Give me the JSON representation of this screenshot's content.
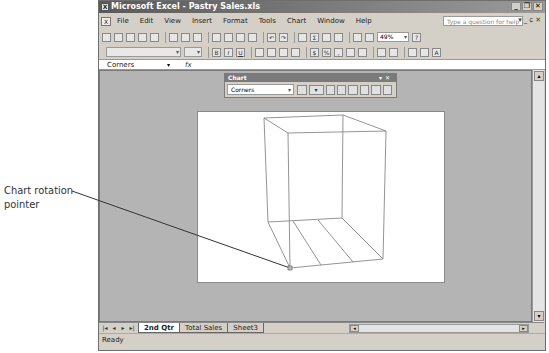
{
  "window": {
    "title": "Microsoft Excel - Pastry Sales.xls",
    "controls": [
      "minimize",
      "restore",
      "close"
    ]
  },
  "menubar": {
    "items": [
      "File",
      "Edit",
      "View",
      "Insert",
      "Format",
      "Tools",
      "Chart",
      "Window",
      "Help"
    ],
    "help_placeholder": "Type a question for help"
  },
  "standard_toolbar": {
    "zoom_value": "49%"
  },
  "formula_bar": {
    "name_box": "Corners",
    "fx_label": "fx",
    "formula": ""
  },
  "chart_toolbar": {
    "title": "Chart",
    "chart_objects_value": "Corners"
  },
  "sheet_tabs": {
    "tabs": [
      "2nd Qtr",
      "Total Sales",
      "Sheet3"
    ],
    "active": "2nd Qtr"
  },
  "status_bar": {
    "text": "Ready"
  },
  "callout": {
    "line1": "Chart rotation",
    "line2": "pointer"
  }
}
